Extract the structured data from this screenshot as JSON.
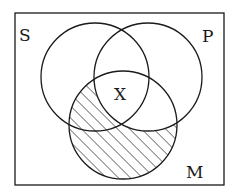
{
  "diagram": {
    "type": "venn",
    "universe": {
      "x": 15,
      "y": 13,
      "width": 209,
      "height": 172
    },
    "sets": [
      {
        "id": "S",
        "label": "S",
        "cx": 95,
        "cy": 77,
        "r": 54,
        "label_x": 19,
        "label_y": 41
      },
      {
        "id": "P",
        "label": "P",
        "cx": 148,
        "cy": 77,
        "r": 54,
        "label_x": 202,
        "label_y": 42
      },
      {
        "id": "M",
        "label": "M",
        "cx": 123,
        "cy": 125,
        "r": 54,
        "label_x": 186,
        "label_y": 178
      }
    ],
    "shaded_region": "M minus P",
    "marks": [
      {
        "label": "X",
        "x": 114,
        "y": 100,
        "region": "S ∩ P ∩ M"
      }
    ],
    "colors": {
      "stroke": "#1a1a1a",
      "background": "#ffffff",
      "hatch": "#1a1a1a"
    }
  }
}
